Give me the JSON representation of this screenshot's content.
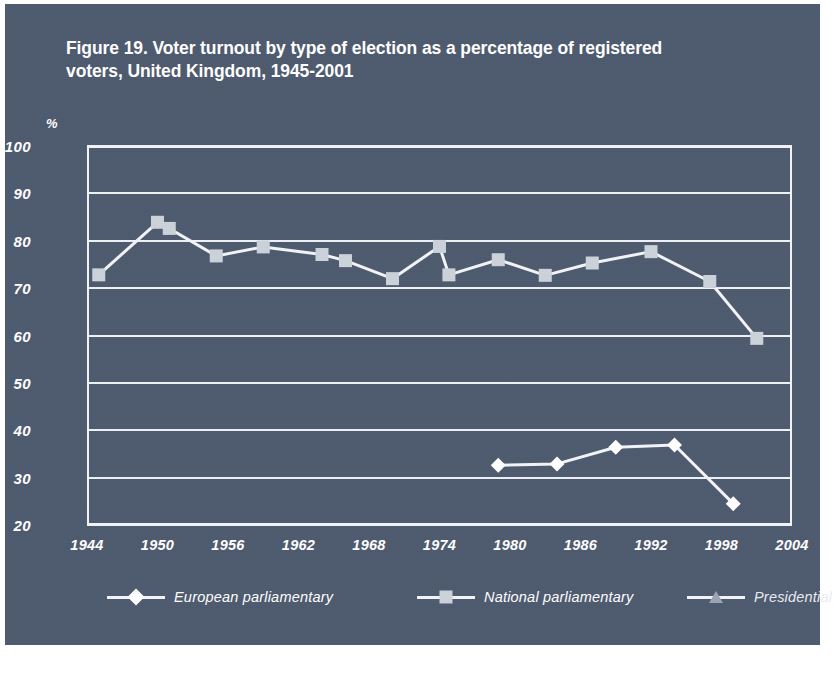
{
  "figure": {
    "title": "Figure 19. Voter turnout by type of election as a percentage of registered voters, United Kingdom, 1945-2001",
    "background_color": "#4e5a6e",
    "ink_color": "#ffffff"
  },
  "chart_data": {
    "type": "line",
    "title": "Figure 19. Voter turnout by type of election as a percentage of registered voters, United Kingdom, 1945-2001",
    "xlabel": "",
    "ylabel": "%",
    "y_unit_label": "%",
    "xlim": [
      1944,
      2004
    ],
    "ylim": [
      20,
      100
    ],
    "y_ticks": [
      100,
      90,
      80,
      70,
      60,
      50,
      40,
      30,
      20
    ],
    "x_ticks": [
      1944,
      1950,
      1956,
      1962,
      1968,
      1974,
      1980,
      1986,
      1992,
      1998,
      2004
    ],
    "x_tick_labels": [
      "1944",
      "1950",
      "1956",
      "1962",
      "1968",
      "1974",
      "1980",
      "1986",
      "1992",
      "1998",
      "2004"
    ],
    "y_tick_labels": [
      "100",
      "90",
      "80",
      "70",
      "60",
      "50",
      "40",
      "30",
      "20"
    ],
    "grid": true,
    "grid_axis": "y",
    "legend_position": "bottom",
    "series": [
      {
        "name": "European parliamentary",
        "marker": "diamond",
        "color": "#ffffff",
        "points": [
          {
            "x": 1979,
            "y": 32.6
          },
          {
            "x": 1984,
            "y": 32.9
          },
          {
            "x": 1989,
            "y": 36.4
          },
          {
            "x": 1994,
            "y": 36.9
          },
          {
            "x": 1999,
            "y": 24.5
          }
        ]
      },
      {
        "name": "National parliamentary",
        "marker": "square",
        "color": "#ccd2da",
        "points": [
          {
            "x": 1945,
            "y": 72.8
          },
          {
            "x": 1950,
            "y": 83.9
          },
          {
            "x": 1951,
            "y": 82.6
          },
          {
            "x": 1955,
            "y": 76.8
          },
          {
            "x": 1959,
            "y": 78.7
          },
          {
            "x": 1964,
            "y": 77.1
          },
          {
            "x": 1966,
            "y": 75.8
          },
          {
            "x": 1970,
            "y": 72.0
          },
          {
            "x": 1974,
            "y": 78.8
          },
          {
            "x": 1974.8,
            "y": 72.8
          },
          {
            "x": 1979,
            "y": 76.0
          },
          {
            "x": 1983,
            "y": 72.7
          },
          {
            "x": 1987,
            "y": 75.3
          },
          {
            "x": 1992,
            "y": 77.7
          },
          {
            "x": 1997,
            "y": 71.4
          },
          {
            "x": 2001,
            "y": 59.4
          }
        ]
      },
      {
        "name": "Presidential",
        "marker": "triangle",
        "color": "#9aa4b2",
        "points": []
      }
    ]
  },
  "legend": {
    "entries": [
      {
        "label": "European parliamentary",
        "marker": "diamond"
      },
      {
        "label": "National parliamentary",
        "marker": "square"
      },
      {
        "label": "Presidential",
        "marker": "triangle"
      }
    ]
  }
}
